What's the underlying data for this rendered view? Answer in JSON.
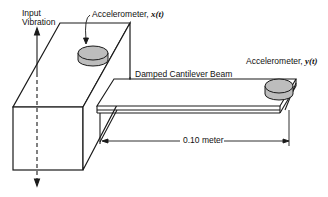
{
  "labels": {
    "input_vibration_line1": "Input",
    "input_vibration_line2": "Vibration",
    "accel_x_prefix": "Accelerometer, ",
    "accel_x_var": "x(t)",
    "accel_y_prefix": "Accelerometer, ",
    "accel_y_var": "y(t)",
    "beam": "Damped Cantilever Beam",
    "dimension": "0.10 meter"
  },
  "colors": {
    "line": "#1a1a1a",
    "accelerometer_fill": "#bdbdbd",
    "background": "#ffffff"
  }
}
